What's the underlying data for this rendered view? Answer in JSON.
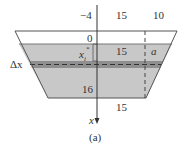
{
  "figure": {
    "caption": "(a)",
    "labels": {
      "top_left_offset": "−4",
      "top_mid_width": "15",
      "top_right_width": "10",
      "zero_level": "0",
      "xi_star": "x",
      "xi_star_sub": "i",
      "xi_star_sup": "*",
      "water_mid_width": "15",
      "water_right_param": "a",
      "delta_x": "Δx",
      "depth_bottom": "16",
      "bottom_width": "15",
      "axis_label": "x"
    },
    "colors": {
      "water_fill": "#c8c8c8",
      "strip_fill": "#8f8f8f",
      "outline": "#555555",
      "background": "#ffffff"
    }
  }
}
